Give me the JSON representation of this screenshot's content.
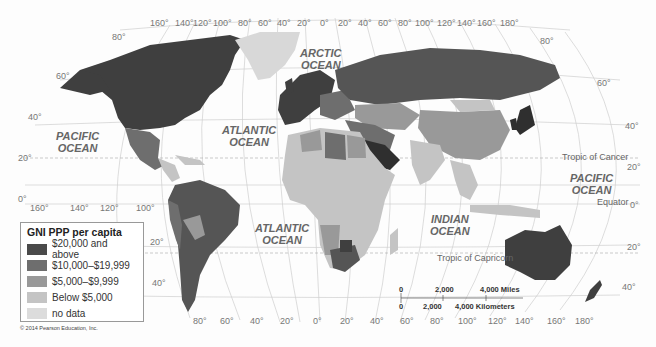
{
  "legend": {
    "title": "GNI PPP per capita",
    "items": [
      {
        "label": "$20,000 and above",
        "color": "#4a4a4a"
      },
      {
        "label": "$10,000–$19,999",
        "color": "#6e6e6e"
      },
      {
        "label": "$5,000–$9,999",
        "color": "#999999"
      },
      {
        "label": "Below $5,000",
        "color": "#c4c4c4"
      },
      {
        "label": "no data",
        "color": "#dcdcdc"
      }
    ]
  },
  "oceans": {
    "arctic": [
      "ARCTIC",
      "OCEAN"
    ],
    "pacific_west": [
      "PACIFIC",
      "OCEAN"
    ],
    "atlantic_north": [
      "ATLANTIC",
      "OCEAN"
    ],
    "atlantic_south": [
      "ATLANTIC",
      "OCEAN"
    ],
    "indian": [
      "INDIAN",
      "OCEAN"
    ],
    "pacific_east": [
      "PACIFIC",
      "OCEAN"
    ]
  },
  "lines": {
    "tropic_cancer": "Tropic of Cancer",
    "tropic_capricorn": "Tropic of Capricorn",
    "equator": "Equator"
  },
  "top_longitudes": [
    "160°",
    "140°",
    "120°",
    "100°",
    "80°",
    "60°",
    "40°",
    "20°",
    "0°",
    "20°",
    "40°",
    "60°",
    "80°",
    "100°",
    "120°",
    "140°",
    "160°",
    "180°"
  ],
  "bottom_longitudes_left": [
    "160°",
    "140°",
    "120°",
    "100°"
  ],
  "bottom_longitudes": [
    "80°",
    "60°",
    "40°",
    "20°",
    "0°",
    "20°",
    "40°",
    "60°",
    "80°",
    "100°",
    "120°",
    "140°",
    "160°",
    "180°"
  ],
  "left_latitudes": [
    "80°",
    "60°",
    "40°",
    "20°",
    "0°",
    "20°",
    "40°"
  ],
  "right_latitudes": [
    "80°",
    "60°",
    "40°",
    "20°",
    "0°",
    "20°",
    "40°"
  ],
  "scale": {
    "miles": [
      "0",
      "2,000",
      "4,000 Miles"
    ],
    "km": [
      "0",
      "2,000",
      "4,000 Kilometers"
    ]
  },
  "copyright": "© 2014 Pearson Education, Inc."
}
